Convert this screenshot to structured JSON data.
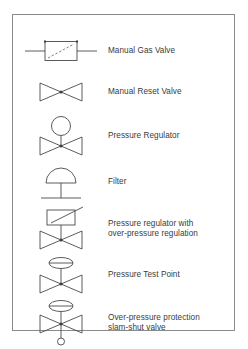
{
  "panel": {
    "name": "gas-valve-symbol-legend",
    "border_color": "#8a8a8a",
    "background": "#ffffff",
    "line_color": "#4a4a4a",
    "text_color": "#3b3b3b"
  },
  "legend": {
    "rows": [
      {
        "symbol": "manual-gas-valve-symbol",
        "label": "Manual Gas Valve"
      },
      {
        "symbol": "manual-reset-valve-symbol",
        "label": "Manual Reset  Valve"
      },
      {
        "symbol": "pressure-regulator-symbol",
        "label": "Pressure Regulator"
      },
      {
        "symbol": "filter-symbol",
        "label": "Filter"
      },
      {
        "symbol": "pressure-regulator-over-pressure-symbol",
        "label": "Pressure regulator with\nover-pressure regulation"
      },
      {
        "symbol": "pressure-test-point-symbol",
        "label": "Pressure Test Point"
      },
      {
        "symbol": "slam-shut-valve-symbol",
        "label": "Over-pressure protection\nslam-shut valve"
      }
    ]
  }
}
